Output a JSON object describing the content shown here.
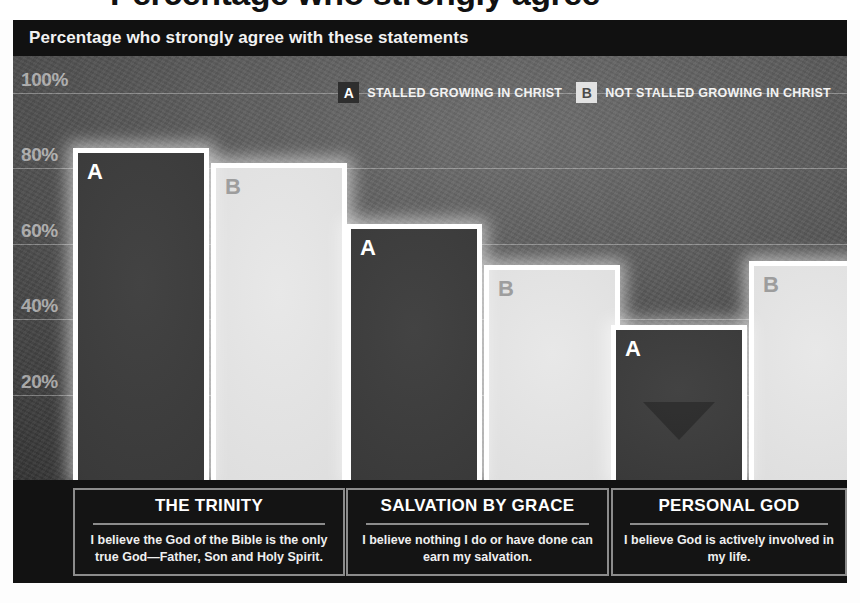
{
  "headline": {
    "cropped_text": "Percentage who strongly agree"
  },
  "subtitle": "Percentage who strongly agree with these statements",
  "legend": {
    "items": [
      {
        "key": "A",
        "label": "STALLED GROWING IN CHRIST"
      },
      {
        "key": "B",
        "label": "NOT STALLED GROWING IN CHRIST"
      }
    ]
  },
  "axis": {
    "ticks": [
      "100%",
      "80%",
      "60%",
      "40%",
      "20%"
    ]
  },
  "captions": [
    {
      "title": "THE TRINITY",
      "body": "I believe the God of the Bible is the only true God—Father, Son and Holy Spirit."
    },
    {
      "title": "SALVATION BY GRACE",
      "body": "I believe nothing I do or have done can earn my salvation."
    },
    {
      "title": "PERSONAL GOD",
      "body": "I believe God is actively involved in my life."
    }
  ],
  "bar_letters": {
    "a": "A",
    "b": "B"
  },
  "colors": {
    "panel_background": "#1b1b1b",
    "subtitle_bar": "#111111",
    "bar_a_fill": "#3a3a3a",
    "bar_b_fill": "#dedede",
    "bar_outline": "#ffffff",
    "gridline": "#ebebeb",
    "caption_border": "#8c8c8c"
  },
  "footer_note": "",
  "chart_data": {
    "type": "bar",
    "title": "Percentage who strongly agree",
    "subtitle": "Percentage who strongly agree with these statements",
    "xlabel": "",
    "ylabel": "",
    "ylim": [
      0,
      100
    ],
    "grid": true,
    "legend_position": "top-right",
    "yticks": [
      20,
      40,
      60,
      80,
      100
    ],
    "ytick_labels": [
      "20%",
      "40%",
      "60%",
      "80%",
      "100%"
    ],
    "categories": [
      "THE TRINITY",
      "SALVATION BY GRACE",
      "PERSONAL GOD"
    ],
    "category_statements": [
      "I believe the God of the Bible is the only true God—Father, Son and Holy Spirit.",
      "I believe nothing I do or have done can earn my salvation.",
      "I believe God is actively involved in my life."
    ],
    "series": [
      {
        "name": "STALLED GROWING IN CHRIST",
        "key": "A",
        "color": "#3a3a3a",
        "values": [
          88,
          68,
          41
        ]
      },
      {
        "name": "NOT STALLED GROWING IN CHRIST",
        "key": "B",
        "color": "#dedede",
        "values": [
          84,
          57,
          58
        ]
      }
    ]
  }
}
